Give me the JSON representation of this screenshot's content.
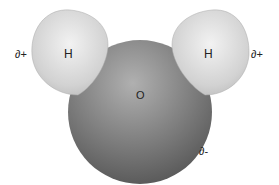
{
  "diagram": {
    "molecule": "water",
    "atoms": {
      "oxygen": {
        "symbol": "O",
        "charge": "∂-",
        "color": "#6f6f6f"
      },
      "hydrogen_left": {
        "symbol": "H",
        "charge": "∂+",
        "color": "#d8d8d8"
      },
      "hydrogen_right": {
        "symbol": "H",
        "charge": "∂+",
        "color": "#d8d8d8"
      }
    }
  }
}
